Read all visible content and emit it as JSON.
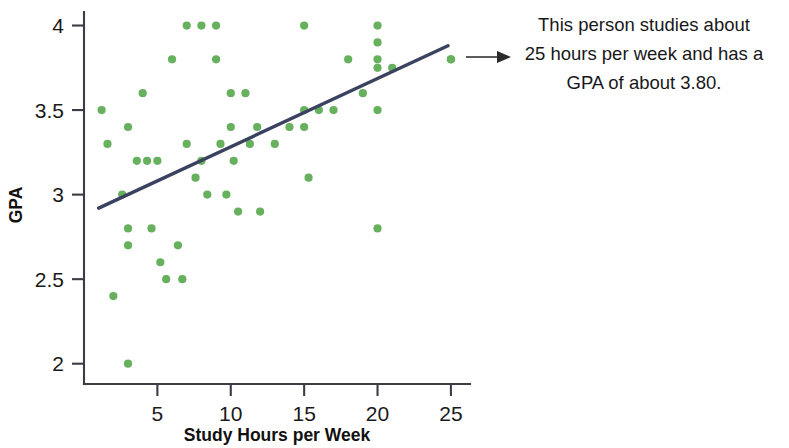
{
  "chart_data": {
    "type": "scatter",
    "title": "",
    "xlabel": "Study Hours per Week",
    "ylabel": "GPA",
    "xlim": [
      0,
      26.3
    ],
    "ylim": [
      1.88,
      4.08
    ],
    "xticks": [
      5,
      10,
      15,
      20,
      25
    ],
    "xtick_labels": [
      "5",
      "10",
      "15",
      "20",
      "25"
    ],
    "yticks": [
      2,
      2.5,
      3,
      3.5,
      4
    ],
    "ytick_labels": [
      "2",
      "2.5",
      "3",
      "3.5",
      "4"
    ],
    "grid": false,
    "legend": null,
    "series": [
      {
        "name": "Students",
        "marker": "circle",
        "color": "#67b15e",
        "points": [
          [
            1.2,
            3.5
          ],
          [
            1.6,
            3.3
          ],
          [
            2.0,
            2.4
          ],
          [
            2.6,
            3.0
          ],
          [
            3.0,
            3.4
          ],
          [
            3.0,
            2.8
          ],
          [
            3.0,
            2.7
          ],
          [
            3.0,
            2.0
          ],
          [
            3.6,
            3.2
          ],
          [
            4.0,
            3.6
          ],
          [
            4.3,
            3.2
          ],
          [
            4.6,
            2.8
          ],
          [
            5.0,
            3.2
          ],
          [
            5.2,
            2.6
          ],
          [
            5.6,
            2.5
          ],
          [
            6.0,
            3.8
          ],
          [
            6.4,
            2.7
          ],
          [
            6.7,
            2.5
          ],
          [
            7.0,
            4.0
          ],
          [
            7.0,
            3.3
          ],
          [
            7.6,
            3.1
          ],
          [
            8.0,
            4.0
          ],
          [
            8.0,
            3.2
          ],
          [
            8.4,
            3.0
          ],
          [
            9.0,
            4.0
          ],
          [
            9.0,
            3.8
          ],
          [
            9.3,
            3.3
          ],
          [
            9.7,
            3.0
          ],
          [
            10.0,
            3.6
          ],
          [
            10.0,
            3.4
          ],
          [
            10.2,
            3.2
          ],
          [
            10.5,
            2.9
          ],
          [
            11.0,
            3.6
          ],
          [
            11.3,
            3.3
          ],
          [
            11.8,
            3.4
          ],
          [
            12.0,
            2.9
          ],
          [
            13.0,
            3.3
          ],
          [
            14.0,
            3.4
          ],
          [
            15.0,
            4.0
          ],
          [
            15.0,
            3.5
          ],
          [
            15.0,
            3.4
          ],
          [
            15.3,
            3.1
          ],
          [
            16.0,
            3.5
          ],
          [
            17.0,
            3.5
          ],
          [
            18.0,
            3.8
          ],
          [
            19.0,
            3.6
          ],
          [
            20.0,
            4.0
          ],
          [
            20.0,
            3.9
          ],
          [
            20.0,
            3.8
          ],
          [
            20.0,
            3.75
          ],
          [
            20.0,
            3.5
          ],
          [
            20.0,
            2.8
          ],
          [
            21.0,
            3.75
          ],
          [
            25.0,
            3.8
          ]
        ]
      }
    ],
    "trend_line": {
      "name": "line of best fit",
      "color": "#3a4260",
      "x_start": 1.0,
      "y_start": 2.92,
      "x_end": 24.8,
      "y_end": 3.88
    },
    "highlighted_point": {
      "x": 25,
      "y": 3.8
    },
    "annotation": {
      "text": "This person studies about\n25 hours per week and has a\nGPA of about 3.80.",
      "arrow": "points-left-to-highlighted-point"
    }
  }
}
